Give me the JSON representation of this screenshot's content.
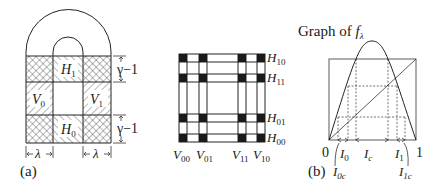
{
  "panel_a": {
    "label": "(a)",
    "regions": {
      "H1": {
        "base": "H",
        "sub": "1"
      },
      "H0": {
        "base": "H",
        "sub": "0"
      },
      "V0": {
        "base": "V",
        "sub": "0"
      },
      "V1": {
        "base": "V",
        "sub": "1"
      }
    },
    "dim_gamma_top": "γ−1",
    "dim_gamma_bottom": "γ−1",
    "dim_lambda_left": "λ",
    "dim_lambda_right": "λ"
  },
  "panel_middle": {
    "col_labels": [
      {
        "base": "V",
        "sub": "00"
      },
      {
        "base": "V",
        "sub": "01"
      },
      {
        "base": "V",
        "sub": "11"
      },
      {
        "base": "V",
        "sub": "10"
      }
    ],
    "row_labels": [
      {
        "base": "H",
        "sub": "10"
      },
      {
        "base": "H",
        "sub": "11"
      },
      {
        "base": "H",
        "sub": "01"
      },
      {
        "base": "H",
        "sub": "00"
      }
    ]
  },
  "panel_b": {
    "label": "(b)",
    "title_prefix": "Graph of ",
    "title_func": "f",
    "title_sub": "λ",
    "axis_zero": "0",
    "axis_one": "1",
    "intervals": {
      "I0": {
        "base": "I",
        "sub": "0"
      },
      "Ic": {
        "base": "I",
        "sub": "c"
      },
      "I1": {
        "base": "I",
        "sub": "1"
      },
      "I0c": {
        "base": "I",
        "sub": "0c"
      },
      "I1c": {
        "base": "I",
        "sub": "1c"
      }
    }
  }
}
